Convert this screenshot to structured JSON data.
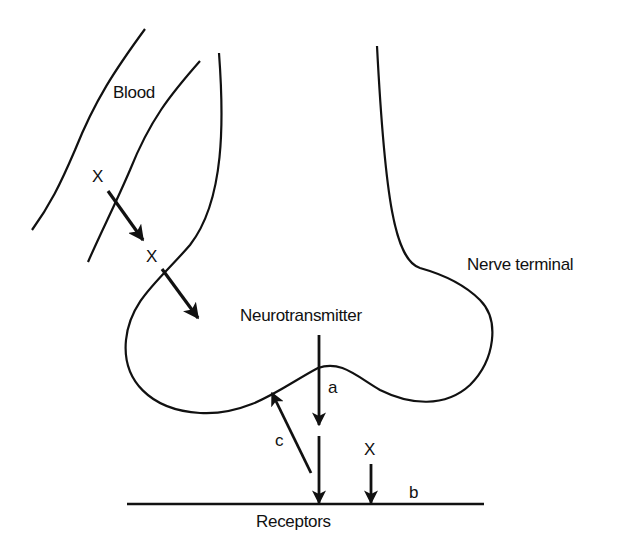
{
  "diagram": {
    "labels": {
      "blood": "Blood",
      "nerve_terminal": "Nerve terminal",
      "neurotransmitter": "Neurotransmitter",
      "receptors": "Receptors",
      "x_in_blood": "X",
      "x_crossing": "X",
      "x_at_receptor": "X",
      "a": "a",
      "b": "b",
      "c": "c"
    },
    "arrows": [
      {
        "id": "x-blood-to-vessel-wall",
        "from": "X (blood)",
        "to": "X (wall)"
      },
      {
        "id": "x-into-terminal",
        "from": "X (wall)",
        "to": "nerve terminal"
      },
      {
        "id": "a-release",
        "from": "Neurotransmitter",
        "to": "synaptic cleft",
        "label": "a"
      },
      {
        "id": "a-to-receptor",
        "from": "synaptic cleft",
        "to": "Receptors"
      },
      {
        "id": "b-x-receptor",
        "from": "X",
        "to": "Receptors",
        "label": "b"
      },
      {
        "id": "c-reuptake",
        "from": "synaptic cleft",
        "to": "nerve terminal",
        "label": "c"
      }
    ],
    "colors": {
      "line": "#111111",
      "background": "#ffffff"
    }
  }
}
